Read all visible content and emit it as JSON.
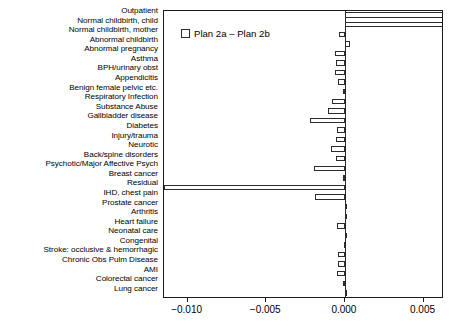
{
  "legend": {
    "swatch_name": "plan-difference-swatch",
    "label": "Plan 2a – Plan 2b"
  },
  "chart_data": {
    "type": "bar",
    "orientation": "horizontal",
    "title": "",
    "xlabel": "",
    "ylabel": "",
    "xlim": [
      -0.0115,
      0.0063
    ],
    "grid": false,
    "legend_position": "top-left inside axes",
    "legend_entries": [
      "Plan 2a – Plan 2b"
    ],
    "xticks": [
      -0.01,
      -0.005,
      0.0,
      0.005
    ],
    "xticklabels": [
      "−0.010",
      "−0.005",
      "0.000",
      "0.005"
    ],
    "categories": [
      "Outpatient",
      "Normal childbirth, child",
      "Normal childbirth, mother",
      "Abnormal childbirth",
      "Abnormal pregnancy",
      "Asthma",
      "BPH/urinary obst",
      "Appendicitis",
      "Benign female pelvic etc.",
      "Respiratory Infection",
      "Substance Abuse",
      "Gallbladder disease",
      "Diabetes",
      "Injury/trauma",
      "Neurotic",
      "Back/spine disorders",
      "Psychotic/Major Affective Psych",
      "Breast cancer",
      "Residual",
      "IHD, chest pain",
      "Prostate cancer",
      "Arthritis",
      "Heart failure",
      "Neonatal care",
      "Congenital",
      "Stroke: occlusive & hemorrhagic",
      "Chronic Obs Pulm Disease",
      "AMI",
      "Colorectal cancer",
      "Lung cancer"
    ],
    "values": [
      0.0094,
      0.00935,
      -0.00035,
      0.0003,
      -0.00065,
      -0.00055,
      -0.0006,
      -0.00045,
      -0.00015,
      -0.00085,
      -0.0011,
      -0.00225,
      -0.0005,
      -0.00055,
      -0.0009,
      -0.00055,
      -0.00195,
      -0.0001,
      -0.0115,
      -0.0019,
      0.00012,
      8e-05,
      -0.0005,
      4e-05,
      -8e-05,
      -0.00045,
      -0.00042,
      -0.0005,
      -0.00012,
      6e-05
    ]
  }
}
